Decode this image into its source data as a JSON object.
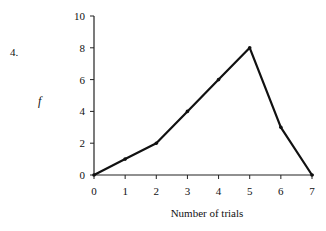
{
  "question_number": "4.",
  "chart_data": {
    "type": "line",
    "title": "",
    "xlabel": "Number of trials",
    "ylabel": "f",
    "x": [
      0,
      1,
      2,
      3,
      4,
      5,
      6,
      7
    ],
    "series": [
      {
        "name": "f",
        "values": [
          0,
          1,
          2,
          4,
          6,
          8,
          3,
          0
        ]
      }
    ],
    "x_ticks": [
      "0",
      "1",
      "2",
      "3",
      "4",
      "5",
      "6",
      "7"
    ],
    "y_ticks": [
      "0",
      "2",
      "4",
      "6",
      "8",
      "10"
    ],
    "xlim": [
      0,
      7
    ],
    "ylim": [
      0,
      10
    ],
    "grid": false,
    "legend": "none",
    "line_color": "#111111"
  }
}
